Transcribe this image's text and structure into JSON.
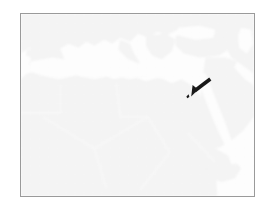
{
  "figure": {
    "kind": "map-image",
    "frame": {
      "border_color": "#9a9a9a",
      "border_width_px": 1,
      "x": 20,
      "y": 13,
      "width": 235,
      "height": 184
    }
  },
  "map": {
    "region_label": "North Africa, Mediterranean and Arabian Peninsula",
    "projection_hint": "equirectangular",
    "colors": {
      "background": "#ffffff",
      "water": "#fdfdfd",
      "land": "#efefef",
      "land_shadow": "#e8e8e8",
      "border_lines": "#fafafa",
      "graticule": "#f4f4f4",
      "marker": "#1a1a1a"
    },
    "graticule": {
      "visible": true,
      "spacing_px": 9
    },
    "water_bodies": [
      "Atlantic Ocean",
      "Mediterranean Sea",
      "Black Sea",
      "Red Sea",
      "Persian Gulf",
      "Gulf of Aden",
      "Arabian Sea",
      "Caspian Sea"
    ],
    "land_masses": [
      "Europe",
      "North Africa",
      "Sahel",
      "Arabian Peninsula",
      "Anatolia",
      "Horn of Africa"
    ]
  },
  "marker": {
    "type": "arrow-pointer",
    "label": "location-arrow",
    "direction": "down-left",
    "color": "#1a1a1a",
    "tip_x": 168,
    "tip_y": 84,
    "target_region": "Eastern Mediterranean / Levant"
  },
  "caption": ""
}
